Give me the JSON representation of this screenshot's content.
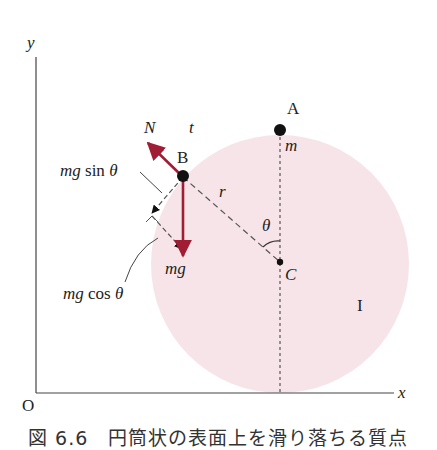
{
  "figure": {
    "axes": {
      "x_label": "x",
      "y_label": "y",
      "origin_label": "O"
    },
    "points": {
      "A": "A",
      "B": "B",
      "C": "C"
    },
    "labels": {
      "mass_top": "m",
      "normal_force": "N",
      "tangent": "t",
      "radius": "r",
      "angle": "θ",
      "gravity": "mg",
      "tangential_component": "mg sin θ",
      "normal_component": "mg cos θ",
      "region": "I"
    },
    "colors": {
      "cylinder_fill": "#f7e4e9",
      "force_arrow": "#a11d33",
      "axis": "#444444",
      "dashed": "#555555",
      "dot": "#111111"
    },
    "caption": "図 6.6　円筒状の表面上を滑り落ちる質点"
  }
}
